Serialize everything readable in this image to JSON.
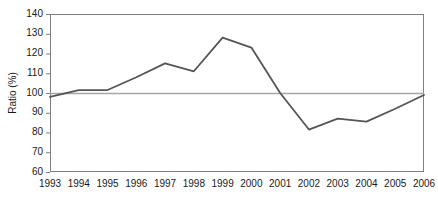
{
  "chart_data": {
    "type": "line",
    "title": "",
    "xlabel": "",
    "ylabel": "Ratio (%)",
    "categories": [
      "1993",
      "1994",
      "1995",
      "1996",
      "1997",
      "1998",
      "1999",
      "2000",
      "2001",
      "2002",
      "2003",
      "2004",
      "2005",
      "2006"
    ],
    "values": [
      98,
      101.5,
      101.5,
      108,
      115,
      111,
      128,
      123,
      100,
      81.5,
      87,
      85.5,
      92,
      99
    ],
    "series": [
      {
        "name": "Ratio",
        "values": [
          98,
          101.5,
          101.5,
          108,
          115,
          111,
          128,
          123,
          100,
          81.5,
          87,
          85.5,
          92,
          99
        ],
        "color": "#555555"
      }
    ],
    "reference_line": {
      "value": 100,
      "color": "#a6a6a6",
      "orientation": "horizontal"
    },
    "ylim": [
      60,
      140
    ],
    "ytick_values": [
      60,
      70,
      80,
      90,
      100,
      110,
      120,
      130,
      140
    ],
    "ytick_labels": [
      "60",
      "70",
      "80",
      "90",
      "100",
      "110",
      "120",
      "130",
      "140"
    ],
    "xtick_labels": [
      "1993",
      "1994",
      "1995",
      "1996",
      "1997",
      "1998",
      "1999",
      "2000",
      "2001",
      "2002",
      "2003",
      "2004",
      "2005",
      "2006"
    ],
    "grid": false,
    "legend": "none",
    "plot_border_color": "#808080",
    "axis_color": "#808080",
    "background_color": "#ffffff"
  },
  "axis_labels": {
    "y_axis_title": "Ratio (%)"
  }
}
